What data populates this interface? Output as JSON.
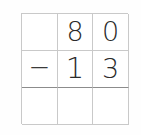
{
  "worksheet": {
    "kind": "vertical-subtraction-grid",
    "rows": 3,
    "columns": 3,
    "colors": {
      "page_background": "#fefefe",
      "cell_background": "#ffffff",
      "grid_line": "#c9c9c9",
      "answer_rule": "#8c8c8c",
      "digit": "#2b2b2b"
    },
    "cells": [
      {
        "name": "minuend-operator",
        "text": "",
        "blank": true
      },
      {
        "name": "minuend-tens",
        "text": "8",
        "blank": false
      },
      {
        "name": "minuend-ones",
        "text": "0",
        "blank": false
      },
      {
        "name": "operator",
        "text": "−",
        "blank": false
      },
      {
        "name": "subtrahend-tens",
        "text": "1",
        "blank": false
      },
      {
        "name": "subtrahend-ones",
        "text": "3",
        "blank": false
      },
      {
        "name": "answer-operator",
        "text": "",
        "blank": true
      },
      {
        "name": "answer-tens",
        "text": "",
        "blank": true
      },
      {
        "name": "answer-ones",
        "text": "",
        "blank": true
      }
    ],
    "problem": {
      "minuend": "80",
      "subtrahend": "13",
      "operator": "−",
      "answer": ""
    }
  }
}
